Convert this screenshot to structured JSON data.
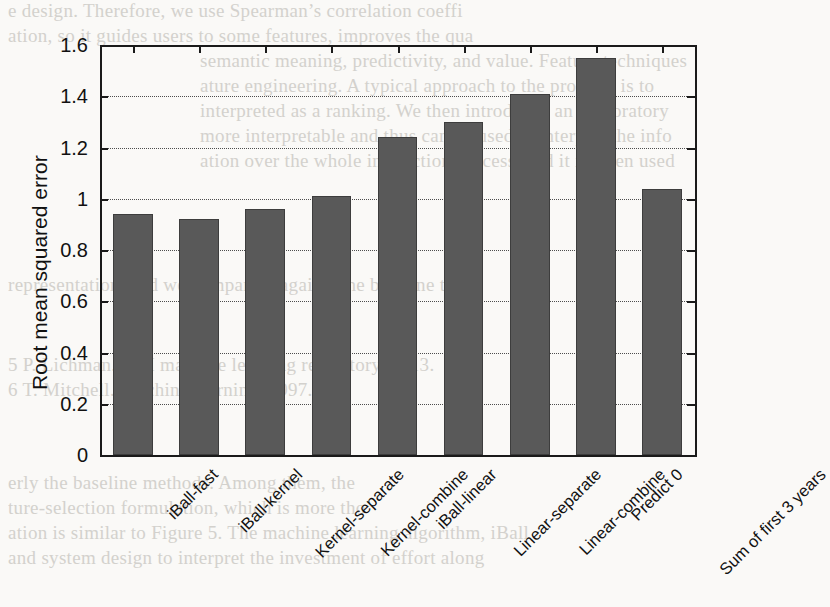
{
  "chart_data": {
    "type": "bar",
    "title": "",
    "xlabel": "",
    "ylabel": "Root mean squared error",
    "ylim": [
      0,
      1.6
    ],
    "yticks": [
      0,
      0.2,
      0.4,
      0.6,
      0.8,
      1,
      1.2,
      1.4,
      1.6
    ],
    "ytick_labels": [
      "0",
      "0.2",
      "0.4",
      "0.6",
      "0.8",
      "1",
      "1.2",
      "1.4",
      "1.6"
    ],
    "grid": "horizontal-dotted",
    "legend": null,
    "bar_color": "#595959",
    "categories": [
      "iBall-fast",
      "iBall-kernel",
      "Kernel-separate",
      "Kernel-combine",
      "iBall-linear",
      "Linear-separate",
      "Linear-combine",
      "Predict 0",
      "Sum of first 3 years"
    ],
    "values": [
      0.94,
      0.92,
      0.96,
      1.01,
      1.24,
      1.3,
      1.41,
      1.55,
      1.04
    ]
  },
  "ghost_text": {
    "lines": [
      "e design. Therefore, we use Spearman’s correlation coeffi",
      "ation, so it guides users to some features, improves the qua",
      "semantic meaning, predictivity, and value. Feature techniques",
      "ature engineering.  A typical approach to the problem is to",
      "interpreted as a ranking. We then introduced an exploratory",
      "more interpretable and thus can be used to interpret the info",
      "ation over the whole interaction process, and it is often used",
      "representation, and we compare it against the baseline that",
      "",
      "",
      "5 P. Lichman. UCI machine learning repository. 2013.",
      "6 T. Mitchell. Machine learning. 1997.",
      "",
      "erly the baseline methods. Among them, the",
      "ture-selection formulation, which is more tho",
      "ation is similar to Figure 5. The machine learning algorithm, iBall",
      "and system design to interpret the investment of effort along"
    ]
  }
}
